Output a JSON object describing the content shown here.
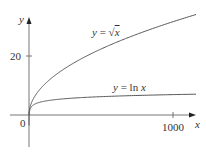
{
  "chart_data": {
    "type": "line",
    "title": "",
    "xlabel": "x",
    "ylabel": "y",
    "x_ticks": [
      "0",
      "1000"
    ],
    "y_ticks": [
      "20"
    ],
    "xlim": [
      0,
      1160
    ],
    "ylim": [
      -10,
      38
    ],
    "grid": false,
    "series": [
      {
        "name": "y = √x",
        "x": [
          0,
          10,
          50,
          100,
          200,
          400,
          600,
          800,
          1000,
          1160
        ],
        "values": [
          0,
          3.16,
          7.07,
          10,
          14.14,
          20,
          24.49,
          28.28,
          31.62,
          34.06
        ]
      },
      {
        "name": "y = ln x",
        "x": [
          0.05,
          0.5,
          1,
          10,
          50,
          100,
          200,
          400,
          600,
          800,
          1000,
          1160
        ],
        "values": [
          -3,
          -0.69,
          0,
          2.3,
          3.91,
          4.61,
          5.3,
          5.99,
          6.4,
          6.68,
          6.91,
          7.06
        ]
      }
    ],
    "annotations": [
      "y = √x",
      "y = ln x"
    ]
  },
  "labels": {
    "y_axis": "y",
    "x_axis": "x",
    "origin": "0",
    "y_tick_20": "20",
    "x_tick_1000": "1000",
    "sqrt_label_prefix": "y = ",
    "sqrt_label_var": "x",
    "ln_label_prefix": "y = ln ",
    "ln_label_var": "x"
  }
}
